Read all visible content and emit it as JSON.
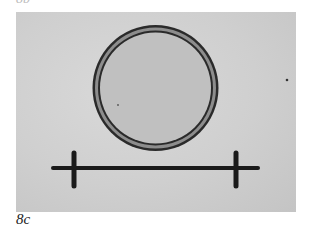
{
  "figure": {
    "top_label": "8b",
    "caption": "8c",
    "panel": {
      "background": "#cfcfcf",
      "circle": {
        "cx": 139.5,
        "cy": 76,
        "outer_r": 64,
        "ring_color": "#2a2a2a",
        "band_color": "#8d8d8d",
        "fill": "#c2c2c2"
      },
      "scale_bar": {
        "x1": 37,
        "x2": 242,
        "y": 156,
        "ticks_x": [
          58,
          220
        ],
        "tick_top": 140,
        "tick_bottom": 175,
        "color": "#1a1a1a"
      }
    }
  }
}
